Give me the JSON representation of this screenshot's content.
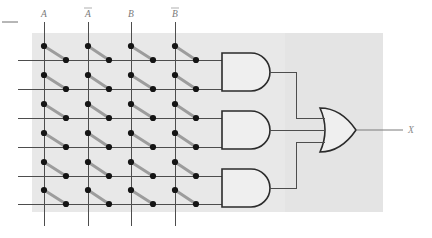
{
  "figure": {
    "background_color": "#ffffff",
    "array_panel_color": "#e8e8e8",
    "array_panel_color_right": "#e4e4e4",
    "wire_color": "#4a4a4a",
    "fuse_link_color": "#9a9a9a",
    "node_color": "#1a1a1a",
    "gate_fill": "#efefef",
    "gate_stroke": "#2b2b2b",
    "label_color": "#7a7a7a"
  },
  "inputs": [
    {
      "id": "in-a",
      "label": "A",
      "overbar": false,
      "x": 44,
      "label_x": 44,
      "label_y": 16
    },
    {
      "id": "in-a-bar",
      "label": "A",
      "overbar": true,
      "x": 88,
      "label_x": 88,
      "label_y": 16
    },
    {
      "id": "in-b",
      "label": "B",
      "overbar": false,
      "x": 131,
      "label_x": 131,
      "label_y": 16
    },
    {
      "id": "in-b-bar",
      "label": "B",
      "overbar": true,
      "x": 175,
      "label_x": 175,
      "label_y": 16
    }
  ],
  "input_line": {
    "top_y": 22,
    "bottom_y": 226
  },
  "product_rows": [
    {
      "id": "row-1",
      "y": 60,
      "left_x": 18,
      "right_x": 222
    },
    {
      "id": "row-2",
      "y": 89,
      "left_x": 18,
      "right_x": 222
    },
    {
      "id": "row-3",
      "y": 118,
      "left_x": 18,
      "right_x": 222
    },
    {
      "id": "row-4",
      "y": 147,
      "left_x": 18,
      "right_x": 222
    },
    {
      "id": "row-5",
      "y": 176,
      "left_x": 18,
      "right_x": 222
    },
    {
      "id": "row-6",
      "y": 204,
      "left_x": 18,
      "right_x": 222
    }
  ],
  "fuse_columns": [
    {
      "vertical_x": 44,
      "node_x": 66
    },
    {
      "vertical_x": 88,
      "node_x": 109
    },
    {
      "vertical_x": 131,
      "node_x": 153
    },
    {
      "vertical_x": 175,
      "node_x": 196
    }
  ],
  "fuse_dot_offset_y": -14,
  "array_panel": {
    "x": 32,
    "y": 33,
    "width": 351,
    "height": 179,
    "seam_x": 285
  },
  "and_gates": [
    {
      "id": "and-gate-1",
      "label": "AND",
      "x": 222,
      "y": 53,
      "width": 48,
      "height": 38,
      "out_x": 270,
      "out_y": 72,
      "inputs_y": [
        60,
        89
      ]
    },
    {
      "id": "and-gate-2",
      "label": "AND",
      "x": 222,
      "y": 111,
      "width": 48,
      "height": 38,
      "out_x": 270,
      "out_y": 130,
      "inputs_y": [
        118,
        147
      ]
    },
    {
      "id": "and-gate-3",
      "label": "AND",
      "x": 222,
      "y": 169,
      "width": 48,
      "height": 38,
      "out_x": 270,
      "out_y": 188,
      "inputs_y": [
        176,
        204
      ]
    }
  ],
  "or_gate": {
    "id": "or-gate-1",
    "label": "OR",
    "x": 320,
    "y": 108,
    "width": 55,
    "height": 44,
    "inputs_y": [
      118,
      130,
      142
    ],
    "out_x": 375,
    "out_y": 130
  },
  "output": {
    "id": "out-x",
    "label": "X",
    "wire_from_x": 375,
    "wire_to_x": 403,
    "y": 130,
    "label_x": 411,
    "label_y": 133
  },
  "tick_mark": {
    "x1": 2,
    "x2": 18,
    "y": 22
  },
  "interconnect": {
    "trunk_x": 296,
    "and1_to_or": {
      "from_y": 72,
      "to_y": 118
    },
    "and2_to_or": {
      "from_y": 130,
      "to_y": 130
    },
    "and3_to_or": {
      "from_y": 188,
      "to_y": 142
    }
  }
}
